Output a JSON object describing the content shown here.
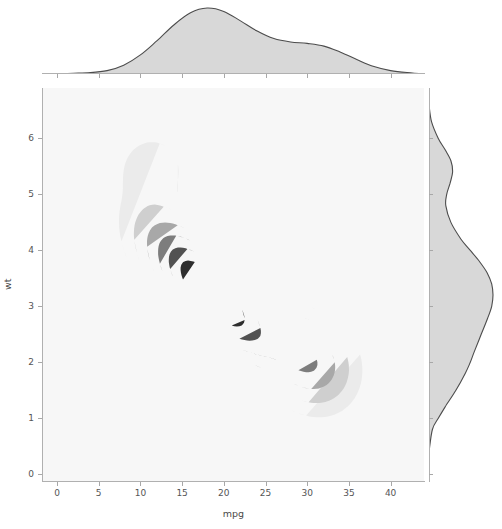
{
  "figure": {
    "kind": "joint-kde-plot",
    "background": "#ffffff",
    "panel_background": "#f7f7f7",
    "line_color": "#4c4c4c",
    "marginal_fill": "#d8d8d8"
  },
  "axes": {
    "x_label": "mpg",
    "y_label": "wt",
    "x_ticks": [
      "0",
      "5",
      "10",
      "15",
      "20",
      "25",
      "30",
      "35",
      "40"
    ],
    "y_ticks": [
      "0",
      "1",
      "2",
      "3",
      "4",
      "5",
      "6"
    ]
  },
  "chart_data": {
    "type": "heatmap",
    "subtype": "bivariate-kde-filled-contour-jointplot",
    "title": "",
    "xlabel": "mpg",
    "ylabel": "wt",
    "xlim": [
      -1.8,
      44.0
    ],
    "ylim": [
      -0.12,
      6.9
    ],
    "x_ticks": [
      0,
      5,
      10,
      15,
      20,
      25,
      30,
      35,
      40
    ],
    "y_ticks": [
      0,
      1,
      2,
      3,
      4,
      5,
      6
    ],
    "grid": false,
    "legend": null,
    "contour_levels": 6,
    "contour_colors": [
      "#ebebeb",
      "#cfcfcf",
      "#a8a8a8",
      "#7d7d7d",
      "#525252",
      "#2e2e2e"
    ],
    "joint_modes": [
      {
        "name": "primary-cluster",
        "mpg": 17.2,
        "wt": 3.45,
        "weight": 1.0
      },
      {
        "name": "secondary-lobe-light-cars",
        "mpg": 30.5,
        "wt": 2.0,
        "weight": 0.45
      },
      {
        "name": "heavy-car-outlier-blob",
        "mpg": 11.4,
        "wt": 5.45,
        "weight": 0.18
      }
    ],
    "marginal_x": {
      "name": "mpg density",
      "orientation": "top",
      "peak_x": 18.0,
      "secondary_shoulder_x": 30.0,
      "x": [
        0,
        2,
        4,
        6,
        8,
        10,
        12,
        14,
        16,
        18,
        20,
        22,
        24,
        26,
        28,
        30,
        32,
        34,
        36,
        38,
        40,
        42,
        44
      ],
      "density": [
        0.0,
        0.001,
        0.002,
        0.005,
        0.013,
        0.028,
        0.049,
        0.072,
        0.09,
        0.097,
        0.092,
        0.078,
        0.063,
        0.052,
        0.047,
        0.045,
        0.041,
        0.032,
        0.021,
        0.011,
        0.005,
        0.002,
        0.0
      ]
    },
    "marginal_y": {
      "name": "wt density",
      "orientation": "right",
      "peak_y": 3.35,
      "secondary_peak_y": 5.35,
      "y": [
        0.4,
        0.8,
        1.0,
        1.2,
        1.5,
        1.8,
        2.0,
        2.2,
        2.5,
        2.8,
        3.0,
        3.2,
        3.4,
        3.6,
        3.8,
        4.0,
        4.2,
        4.5,
        4.8,
        5.0,
        5.2,
        5.4,
        5.6,
        5.8,
        6.0,
        6.3,
        6.6
      ],
      "density": [
        0.0,
        0.02,
        0.055,
        0.095,
        0.16,
        0.215,
        0.245,
        0.27,
        0.31,
        0.35,
        0.372,
        0.38,
        0.372,
        0.345,
        0.3,
        0.245,
        0.19,
        0.13,
        0.1,
        0.105,
        0.125,
        0.14,
        0.13,
        0.095,
        0.055,
        0.015,
        0.0
      ]
    }
  }
}
